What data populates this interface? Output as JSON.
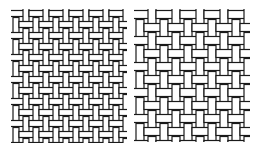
{
  "figure": {
    "background": "#ffffff",
    "stroke": "#1a1a1a",
    "panels": [
      {
        "name": "fine-basket-weave",
        "x": 11,
        "y": 9,
        "width": 116,
        "height": 134,
        "cell_w": 10,
        "cell_h": 11,
        "strand": 6
      },
      {
        "name": "coarse-basket-weave",
        "x": 134,
        "y": 9,
        "width": 116,
        "height": 133,
        "cell_w": 12,
        "cell_h": 13,
        "strand": 8
      }
    ]
  }
}
